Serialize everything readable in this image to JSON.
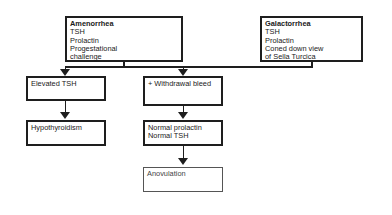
{
  "diagram": {
    "top_boxes": {
      "amenorrhea": {
        "title": "Amenorrhea",
        "lines": [
          "TSH",
          "Prolactin",
          "Progestational",
          "challenge"
        ]
      },
      "galactorrhea": {
        "title": "Galactorrhea",
        "lines": [
          "TSH",
          "Prolactin",
          "Coned down view",
          "of Sella Turcica"
        ]
      }
    },
    "left_branch": {
      "elevated_tsh": "Elevated TSH",
      "hypothyroidism": "Hypothyroidism"
    },
    "middle_branch": {
      "withdrawal_bleed": "+ Withdrawal bleed",
      "normal_results": [
        "Normal prolactin",
        "Normal TSH"
      ],
      "anovulation": "Anovulation"
    },
    "colors": {
      "line": "#1e1e1e",
      "background": "#ffffff",
      "faded_box_border": "#555555"
    }
  }
}
